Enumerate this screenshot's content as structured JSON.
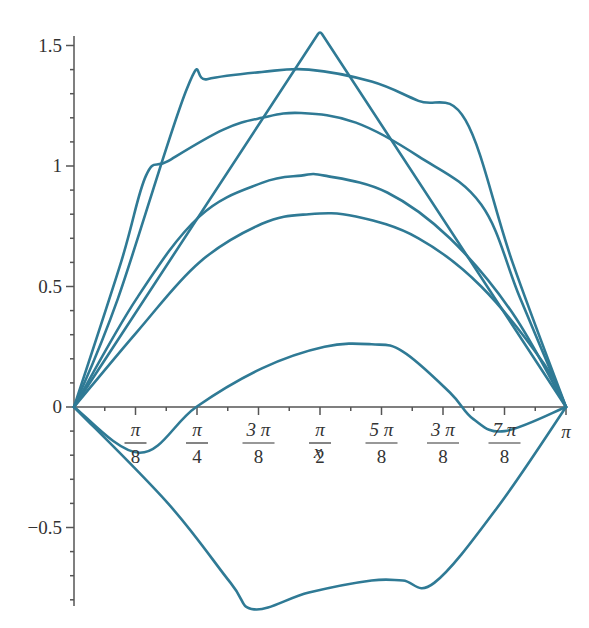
{
  "chart_data": {
    "type": "line",
    "title": "",
    "xlabel": "x",
    "ylabel": "",
    "xlim": [
      0,
      3.14159
    ],
    "ylim": [
      -0.85,
      1.6
    ],
    "grid": false,
    "legend": null,
    "line_color": "#2f7a95",
    "x_ticks": [
      {
        "num": "π",
        "den": "8",
        "value": 0.3927
      },
      {
        "num": "π",
        "den": "4",
        "value": 0.7854
      },
      {
        "num": "3 π",
        "den": "8",
        "value": 1.1781
      },
      {
        "num": "π",
        "den": "2",
        "value": 1.5708
      },
      {
        "num": "5 π",
        "den": "8",
        "value": 1.9635
      },
      {
        "num": "3 π",
        "den": "8",
        "value": 2.3562
      },
      {
        "num": "7 π",
        "den": "8",
        "value": 2.7489
      },
      {
        "num": "π",
        "den": "",
        "value": 3.1416
      }
    ],
    "y_ticks": [
      {
        "label": "1.5",
        "value": 1.5
      },
      {
        "label": "1",
        "value": 1.0
      },
      {
        "label": "0.5",
        "value": 0.5
      },
      {
        "label": "0",
        "value": 0.0
      },
      {
        "label": "−0.5",
        "value": -0.5
      }
    ],
    "series": [
      {
        "name": "triangle",
        "x": [
          0,
          1.5708,
          3.1416
        ],
        "y": [
          0,
          1.56,
          0
        ]
      },
      {
        "name": "flat-top",
        "x": [
          0,
          0.28,
          0.72,
          0.85,
          1.2,
          1.5,
          1.9,
          2.2,
          2.5,
          2.8,
          3.1416
        ],
        "y": [
          0,
          0.45,
          1.32,
          1.36,
          1.39,
          1.4,
          1.35,
          1.27,
          1.19,
          0.6,
          0
        ]
      },
      {
        "name": "knee-curve",
        "x": [
          0,
          0.3,
          0.46,
          0.6,
          0.95,
          1.2,
          1.45,
          1.8,
          2.2,
          2.6,
          2.85,
          3.1416
        ],
        "y": [
          0,
          0.6,
          0.96,
          1.02,
          1.15,
          1.2,
          1.22,
          1.18,
          1.04,
          0.84,
          0.45,
          0
        ]
      },
      {
        "name": "arc-0.96",
        "x": [
          0,
          0.4,
          0.8,
          1.2,
          1.45,
          1.6,
          2.0,
          2.4,
          2.8,
          3.1416
        ],
        "y": [
          0,
          0.45,
          0.79,
          0.93,
          0.96,
          0.96,
          0.89,
          0.7,
          0.39,
          0
        ]
      },
      {
        "name": "arc-0.80",
        "x": [
          0,
          0.4,
          0.8,
          1.2,
          1.5,
          1.8,
          2.2,
          2.6,
          3.0,
          3.1416
        ],
        "y": [
          0,
          0.31,
          0.6,
          0.76,
          0.8,
          0.79,
          0.7,
          0.5,
          0.18,
          0
        ]
      },
      {
        "name": "wave",
        "x": [
          0,
          0.42,
          0.78,
          1.2,
          1.6,
          1.9,
          2.1,
          2.4,
          2.55,
          2.75,
          3.1416
        ],
        "y": [
          0,
          -0.19,
          0,
          0.16,
          0.25,
          0.26,
          0.23,
          0.06,
          -0.05,
          -0.1,
          0
        ]
      },
      {
        "name": "bottom",
        "x": [
          0,
          0.6,
          1.0,
          1.15,
          1.5,
          1.9,
          2.1,
          2.3,
          2.7,
          3.1416
        ],
        "y": [
          0,
          -0.4,
          -0.73,
          -0.84,
          -0.77,
          -0.72,
          -0.72,
          -0.73,
          -0.42,
          0
        ]
      }
    ]
  }
}
